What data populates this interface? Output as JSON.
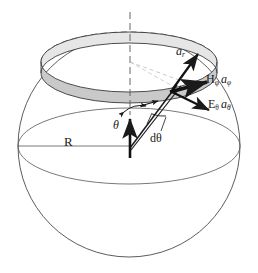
{
  "figure": {
    "kind": "spherical-coordinate-sphere-diagram",
    "background": "#ffffff",
    "stroke_color": "#2b2b2b",
    "band_fill": "#c9c9c9",
    "band_fill_light": "#dedede",
    "canvas": {
      "width": 258,
      "height": 273
    }
  },
  "sphere": {
    "center_x": 129,
    "center_y": 146,
    "radius": 111,
    "equator_ry": 38
  },
  "ring": {
    "center_y_top": 62,
    "rx": 88,
    "ry": 30,
    "thickness": 11,
    "description": "shaded annular strip of width d-theta on the sphere surface"
  },
  "labels": {
    "a_r": {
      "base": "a",
      "sub": "r",
      "x": 176,
      "y": 52,
      "italic": true
    },
    "H_phi": {
      "base": "H",
      "sub": "φ",
      "vec": "a",
      "vecsub": "φ",
      "x": 206,
      "y": 79
    },
    "E_theta": {
      "base": "E",
      "sub": "θ",
      "vec": "a",
      "vecsub": "θ",
      "x": 210,
      "y": 104
    },
    "theta": {
      "text": "θ",
      "x": 115,
      "y": 123
    },
    "d_theta": {
      "text": "dθ",
      "x": 152,
      "y": 137
    },
    "R": {
      "text": "R",
      "x": 67,
      "y": 141
    }
  },
  "vectors": [
    {
      "name": "a-r-unit-vector",
      "label": "a_r",
      "from": [
        172,
        90
      ],
      "to": [
        197,
        55
      ]
    },
    {
      "name": "h-phi-unit-vector",
      "label": "H_phi a_phi",
      "from": [
        172,
        90
      ],
      "to": [
        208,
        84
      ]
    },
    {
      "name": "e-theta-unit-vector",
      "label": "E_theta a_theta",
      "from": [
        172,
        90
      ],
      "to": [
        209,
        111
      ]
    },
    {
      "name": "radial-ray",
      "label": "radial line from origin to surface point",
      "from": [
        130,
        147
      ],
      "to": [
        176,
        86
      ]
    },
    {
      "name": "polar-axis-arrow",
      "label": "vertical polar direction",
      "from": [
        130,
        152
      ],
      "to": [
        130,
        115
      ]
    }
  ],
  "arcs": [
    {
      "name": "theta-angle-arc",
      "label": "θ"
    },
    {
      "name": "d-theta-angle-arc",
      "label": "dθ"
    }
  ]
}
